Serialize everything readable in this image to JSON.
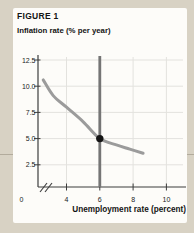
{
  "figure": {
    "label": "FIGURE 1"
  },
  "chart_data": {
    "type": "line",
    "title": "FIGURE 1",
    "ylabel": "Inflation rate (% per year)",
    "xlabel": "Unemployment rate (percent)",
    "xlim": [
      0,
      11
    ],
    "ylim": [
      0,
      13.5
    ],
    "grid": true,
    "x_axis_break_after_zero": true,
    "x_ticks": [
      {
        "value": 0,
        "label": "0"
      },
      {
        "value": 4,
        "label": "4"
      },
      {
        "value": 6,
        "label": "6"
      },
      {
        "value": 8,
        "label": "8"
      },
      {
        "value": 10,
        "label": "10"
      }
    ],
    "y_ticks": [
      {
        "value": 2.5,
        "label": "2.5"
      },
      {
        "value": 5.0,
        "label": "5.0"
      },
      {
        "value": 7.5,
        "label": "7.5"
      },
      {
        "value": 10.0,
        "label": "10.0"
      },
      {
        "value": 12.5,
        "label": "12.5"
      }
    ],
    "series": [
      {
        "name": "phillips-curve",
        "type": "curve",
        "color": "#9b9b9b",
        "width": 3,
        "points": [
          [
            2.6,
            10.6
          ],
          [
            3.2,
            9.1
          ],
          [
            4.0,
            8.0
          ],
          [
            5.0,
            6.6
          ],
          [
            6.0,
            5.0
          ],
          [
            7.0,
            4.4
          ],
          [
            7.8,
            4.0
          ],
          [
            8.6,
            3.6
          ]
        ]
      },
      {
        "name": "natural-unemployment-rate-line",
        "type": "vline",
        "x": 6,
        "color": "#757575",
        "width": 2.8
      }
    ],
    "marker": {
      "x": 6,
      "y": 5,
      "color": "#141414"
    }
  },
  "colors": {
    "page_background": "#d8d2c4",
    "card_background": "#fdfcf9",
    "grid": "#e3e2de",
    "axis": "#3d3d3d",
    "tick_text": "#222222",
    "page_rule": "#b2ab9c"
  }
}
